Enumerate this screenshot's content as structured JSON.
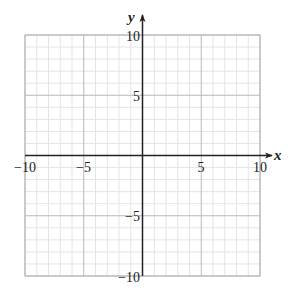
{
  "chart_data": {
    "type": "coordinate-grid",
    "title": "",
    "xlabel": "x",
    "ylabel": "y",
    "xlim": [
      -10,
      10
    ],
    "ylim": [
      -10,
      10
    ],
    "grid": true,
    "minor_step": 1,
    "major_step": 5,
    "x_tick_labels": [
      "-10",
      "-5",
      "5",
      "10"
    ],
    "y_tick_labels": [
      "10",
      "5",
      "-5",
      "-10"
    ],
    "series": []
  },
  "labels": {
    "x_axis": "x",
    "y_axis": "y",
    "x_ticks": [
      {
        "value": -10,
        "text": "−10"
      },
      {
        "value": -5,
        "text": "−5"
      },
      {
        "value": 5,
        "text": "5"
      },
      {
        "value": 10,
        "text": "10"
      }
    ],
    "y_ticks": [
      {
        "value": 10,
        "text": "10"
      },
      {
        "value": 5,
        "text": "5"
      },
      {
        "value": -5,
        "text": "−5"
      },
      {
        "value": -10,
        "text": "−10"
      }
    ]
  },
  "colors": {
    "minor_grid": "#e4e4e4",
    "major_grid": "#b8b8b8",
    "axis": "#222222"
  }
}
